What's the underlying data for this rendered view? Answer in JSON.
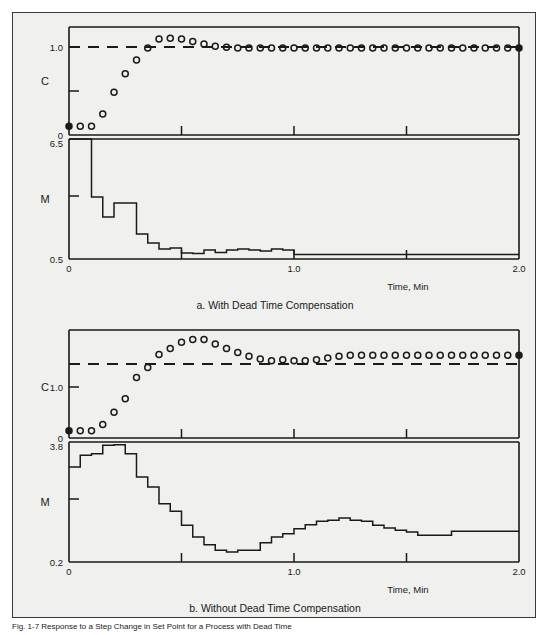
{
  "figure": {
    "caption": "Fig. 1-7  Response to a Step Change in Set Point for a Process with Dead Time"
  },
  "panels": [
    {
      "id": "a",
      "subcaption": "a. With Dead Time Compensation",
      "c_axis": {
        "name": "C",
        "tick_labels": [
          "1.0",
          "0"
        ],
        "label_layout": "stacked"
      },
      "m_axis": {
        "name": "M",
        "tick_labels": [
          "6.5",
          "0.5"
        ]
      },
      "x_axis": {
        "label": "Time, Min",
        "tick_labels": [
          "0",
          "1.0",
          "2.0"
        ]
      },
      "chart_data": {
        "type": "line",
        "title": "a. With Dead Time Compensation",
        "xlabel": "Time, Min",
        "xlim": [
          0,
          2.0
        ],
        "xticks": [
          0,
          1.0,
          2.0
        ],
        "minor_xticks": [
          0.5,
          1.5
        ],
        "grid": false,
        "legend": "none",
        "subplots": [
          {
            "name": "C",
            "ylabel": "C",
            "ylim": [
              -0.08,
              1.26
            ],
            "yticks": [
              0,
              1.0
            ],
            "ytick_labels": [
              "0",
              "1.0"
            ],
            "series": [
              {
                "name": "setpoint",
                "type": "line",
                "style": "dashed",
                "value": 1.0,
                "x": [
                  0,
                  2.0
                ],
                "values": [
                  1.0,
                  1.0
                ]
              },
              {
                "name": "controlled variable C",
                "type": "scatter",
                "marker": "open-circle",
                "x": [
                  0.0,
                  0.05,
                  0.1,
                  0.15,
                  0.2,
                  0.25,
                  0.3,
                  0.35,
                  0.4,
                  0.45,
                  0.5,
                  0.55,
                  0.6,
                  0.65,
                  0.7,
                  0.75,
                  0.8,
                  0.85,
                  0.9,
                  0.95,
                  1.0,
                  1.05,
                  1.1,
                  1.15,
                  1.2,
                  1.25,
                  1.3,
                  1.35,
                  1.4,
                  1.45,
                  1.5,
                  1.55,
                  1.6,
                  1.65,
                  1.7,
                  1.75,
                  1.8,
                  1.85,
                  1.9,
                  1.95,
                  2.0
                ],
                "values": [
                  0.03,
                  0.03,
                  0.03,
                  0.18,
                  0.45,
                  0.68,
                  0.85,
                  1.0,
                  1.11,
                  1.12,
                  1.11,
                  1.08,
                  1.05,
                  1.02,
                  1.01,
                  1.0,
                  1.0,
                  1.0,
                  1.0,
                  1.0,
                  1.0,
                  1.0,
                  1.0,
                  1.0,
                  1.0,
                  1.0,
                  1.0,
                  1.0,
                  1.0,
                  1.0,
                  1.0,
                  1.0,
                  1.0,
                  1.0,
                  1.0,
                  1.0,
                  1.0,
                  1.0,
                  1.0,
                  1.0,
                  1.0
                ]
              }
            ]
          },
          {
            "name": "M",
            "ylabel": "M",
            "ylim": [
              0.5,
              6.5
            ],
            "yticks": [
              0.5,
              6.5
            ],
            "ytick_labels": [
              "0.5",
              "6.5"
            ],
            "series": [
              {
                "name": "manipulated variable M",
                "type": "step",
                "step_style": "post",
                "x": [
                  0.0,
                  0.05,
                  0.1,
                  0.15,
                  0.2,
                  0.25,
                  0.3,
                  0.35,
                  0.4,
                  0.45,
                  0.5,
                  0.55,
                  0.6,
                  0.65,
                  0.7,
                  0.75,
                  0.8,
                  0.85,
                  0.9,
                  0.95,
                  1.0,
                  2.0
                ],
                "values": [
                  6.5,
                  6.5,
                  3.6,
                  2.6,
                  3.3,
                  3.3,
                  1.75,
                  1.3,
                  1.0,
                  1.05,
                  0.8,
                  0.78,
                  0.95,
                  0.82,
                  0.95,
                  1.0,
                  0.95,
                  0.9,
                  1.0,
                  0.95,
                  0.72,
                  0.72
                ]
              }
            ]
          }
        ]
      }
    },
    {
      "id": "b",
      "subcaption": "b. Without Dead Time Compensation",
      "c_axis": {
        "name": "C",
        "tick_labels": [
          "1.0",
          "0"
        ],
        "label_layout": "inline"
      },
      "m_axis": {
        "name": "M",
        "tick_labels": [
          "3.8",
          "0.2"
        ]
      },
      "x_axis": {
        "label": "Time, Min",
        "tick_labels": [
          "0",
          "1.0",
          "2.0"
        ]
      },
      "chart_data": {
        "type": "line",
        "title": "b. Without Dead Time Compensation",
        "xlabel": "Time, Min",
        "xlim": [
          0,
          2.0
        ],
        "xticks": [
          0,
          1.0,
          2.0
        ],
        "minor_xticks": [
          0.5,
          1.5
        ],
        "grid": false,
        "legend": "none",
        "subplots": [
          {
            "name": "C",
            "ylabel": "C",
            "ylim": [
              -0.08,
              1.85
            ],
            "yticks": [
              0,
              1.0
            ],
            "ytick_labels": [
              "0",
              "1.0"
            ],
            "series": [
              {
                "name": "setpoint",
                "type": "line",
                "style": "dashed",
                "value": 1.4,
                "x": [
                  0,
                  2.0
                ],
                "values": [
                  1.4,
                  1.4
                ]
              },
              {
                "name": "controlled variable C",
                "type": "scatter",
                "marker": "open-circle",
                "x": [
                  0.0,
                  0.05,
                  0.1,
                  0.15,
                  0.2,
                  0.25,
                  0.3,
                  0.35,
                  0.4,
                  0.45,
                  0.5,
                  0.55,
                  0.6,
                  0.65,
                  0.7,
                  0.75,
                  0.8,
                  0.85,
                  0.9,
                  0.95,
                  1.0,
                  1.05,
                  1.1,
                  1.15,
                  1.2,
                  1.25,
                  1.3,
                  1.35,
                  1.4,
                  1.45,
                  1.5,
                  1.55,
                  1.6,
                  1.65,
                  1.7,
                  1.75,
                  1.8,
                  1.85,
                  1.9,
                  1.95,
                  2.0
                ],
                "values": [
                  0.05,
                  0.05,
                  0.05,
                  0.16,
                  0.38,
                  0.62,
                  1.0,
                  1.18,
                  1.41,
                  1.52,
                  1.63,
                  1.68,
                  1.68,
                  1.6,
                  1.52,
                  1.45,
                  1.38,
                  1.33,
                  1.3,
                  1.32,
                  1.3,
                  1.3,
                  1.32,
                  1.35,
                  1.38,
                  1.4,
                  1.4,
                  1.4,
                  1.4,
                  1.4,
                  1.4,
                  1.4,
                  1.4,
                  1.4,
                  1.4,
                  1.4,
                  1.4,
                  1.4,
                  1.4,
                  1.4,
                  1.4
                ]
              }
            ]
          },
          {
            "name": "M",
            "ylabel": "M",
            "ylim": [
              0.2,
              3.8
            ],
            "yticks": [
              0.2,
              3.8
            ],
            "ytick_labels": [
              "0.2",
              "3.8"
            ],
            "series": [
              {
                "name": "manipulated variable M",
                "type": "step",
                "step_style": "post",
                "x": [
                  0.0,
                  0.05,
                  0.1,
                  0.15,
                  0.2,
                  0.25,
                  0.3,
                  0.35,
                  0.4,
                  0.45,
                  0.5,
                  0.55,
                  0.6,
                  0.65,
                  0.7,
                  0.75,
                  0.8,
                  0.85,
                  0.9,
                  0.95,
                  1.0,
                  1.05,
                  1.1,
                  1.15,
                  1.2,
                  1.25,
                  1.3,
                  1.35,
                  1.4,
                  1.45,
                  1.5,
                  1.55,
                  1.6,
                  1.65,
                  1.7,
                  2.0
                ],
                "values": [
                  3.05,
                  3.4,
                  3.45,
                  3.7,
                  3.72,
                  3.45,
                  2.75,
                  2.45,
                  1.95,
                  1.72,
                  1.3,
                  0.95,
                  0.72,
                  0.55,
                  0.5,
                  0.55,
                  0.55,
                  0.78,
                  0.95,
                  1.05,
                  1.2,
                  1.32,
                  1.42,
                  1.45,
                  1.52,
                  1.45,
                  1.42,
                  1.3,
                  1.22,
                  1.15,
                  1.1,
                  1.0,
                  1.0,
                  1.0,
                  1.12,
                  1.12
                ]
              }
            ]
          }
        ]
      }
    }
  ]
}
